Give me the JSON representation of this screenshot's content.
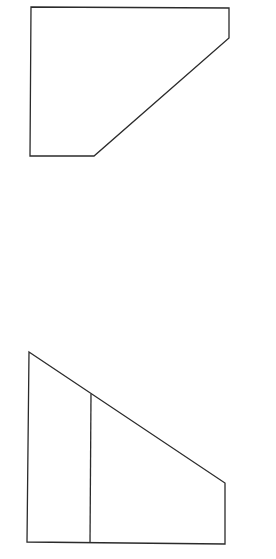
{
  "canvas": {
    "width": 276,
    "height": 559,
    "background": "#ffffff",
    "stroke_color": "#2b2b2b"
  },
  "shapes": [
    {
      "name": "top-view-pentagon",
      "points": "31,7 229,8 229,38 94,156 30,156"
    },
    {
      "name": "front-view-trapezoid",
      "points": "29,352 225,483 225,544 27,542"
    }
  ],
  "lines": [
    {
      "name": "front-view-divider-line",
      "x1": 91,
      "y1": 394,
      "x2": 90,
      "y2": 543
    }
  ]
}
